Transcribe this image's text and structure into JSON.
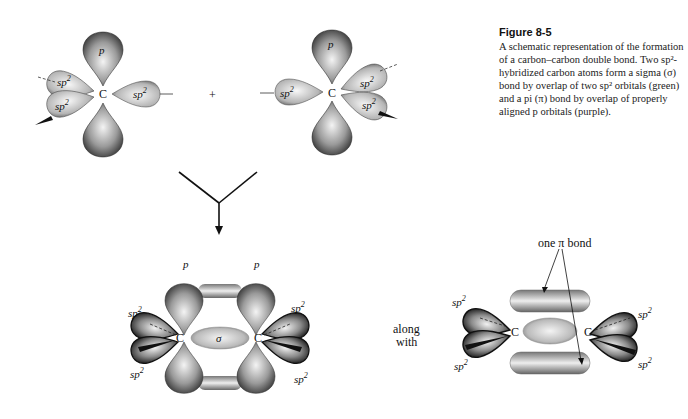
{
  "figure": {
    "number": "Figure 8-5",
    "caption": "A schematic representation of the formation of a carbon–carbon double bond. Two sp²-hybridized carbon atoms form a sigma (σ) bond by overlap of two sp² orbitals (green) and a pi (π) bond by overlap of properly aligned p orbitals (purple)."
  },
  "labels": {
    "p": "p",
    "sp2": "sp",
    "sup2": "2",
    "carbon": "C",
    "sigma": "σ",
    "plus": "+",
    "along": "along",
    "with": "with",
    "pi_bond": "one π bond"
  },
  "colors": {
    "orbital_dark": "#3a3a3a",
    "orbital_light": "#e8e8e8",
    "stroke": "#222222"
  }
}
